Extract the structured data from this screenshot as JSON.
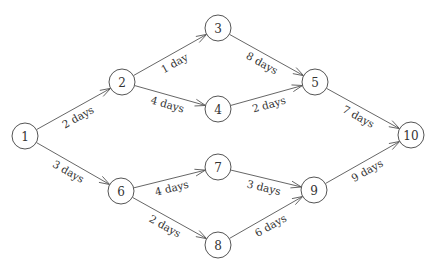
{
  "diagram": {
    "type": "activity-on-node network",
    "node_radius": 13,
    "colors": {
      "line": "#555555",
      "text": "#333333",
      "background": "#ffffff"
    },
    "nodes": [
      {
        "id": "1",
        "label": "1",
        "x": 25,
        "y": 136
      },
      {
        "id": "2",
        "label": "2",
        "x": 122,
        "y": 82
      },
      {
        "id": "3",
        "label": "3",
        "x": 218,
        "y": 28
      },
      {
        "id": "4",
        "label": "4",
        "x": 218,
        "y": 109
      },
      {
        "id": "5",
        "label": "5",
        "x": 315,
        "y": 82
      },
      {
        "id": "6",
        "label": "6",
        "x": 121,
        "y": 191
      },
      {
        "id": "7",
        "label": "7",
        "x": 218,
        "y": 167
      },
      {
        "id": "8",
        "label": "8",
        "x": 218,
        "y": 245
      },
      {
        "id": "9",
        "label": "9",
        "x": 314,
        "y": 190
      },
      {
        "id": "10",
        "label": "10",
        "x": 411,
        "y": 135
      }
    ],
    "edges": [
      {
        "from": "1",
        "to": "2",
        "label": "2 days",
        "side": 1
      },
      {
        "from": "1",
        "to": "6",
        "label": "3 days",
        "side": -1
      },
      {
        "from": "2",
        "to": "3",
        "label": "1 day",
        "side": 1
      },
      {
        "from": "2",
        "to": "4",
        "label": "4 days",
        "side": 1
      },
      {
        "from": "3",
        "to": "5",
        "label": "8 days",
        "side": 1
      },
      {
        "from": "4",
        "to": "5",
        "label": "2 days",
        "side": 1
      },
      {
        "from": "5",
        "to": "10",
        "label": "7 days",
        "side": 1
      },
      {
        "from": "6",
        "to": "7",
        "label": "4 days",
        "side": 1
      },
      {
        "from": "6",
        "to": "8",
        "label": "2 days",
        "side": 1
      },
      {
        "from": "7",
        "to": "9",
        "label": "3 days",
        "side": 1
      },
      {
        "from": "8",
        "to": "9",
        "label": "6 days",
        "side": 1
      },
      {
        "from": "9",
        "to": "10",
        "label": "9 days",
        "side": 1
      }
    ]
  }
}
